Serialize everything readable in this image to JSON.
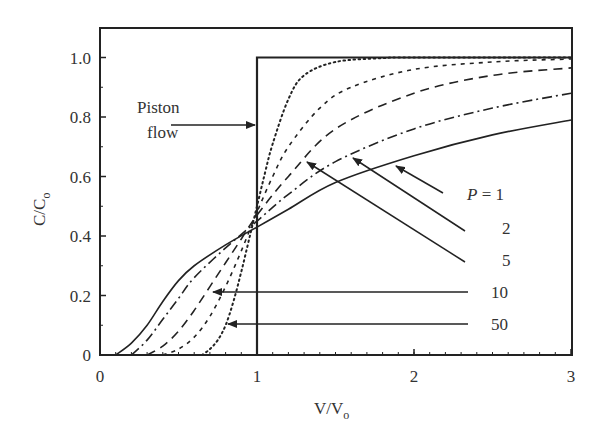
{
  "chart_data": {
    "type": "line",
    "title": "",
    "xlabel": "V/Vo",
    "ylabel": "C/Co",
    "xlim": [
      0,
      3
    ],
    "ylim": [
      0,
      1.1
    ],
    "xticks": [
      0,
      1,
      2,
      3
    ],
    "xtick_labels": [
      "0",
      "1",
      "2",
      "3"
    ],
    "yticks": [
      0,
      0.2,
      0.4,
      0.6,
      0.8,
      1.0
    ],
    "ytick_labels": [
      "0",
      "0.2",
      "0.4",
      "0.6",
      "0.8",
      "1.0"
    ],
    "grid": false,
    "legend": "inline annotations with arrows",
    "series": [
      {
        "name": "P = 1",
        "style": "solid",
        "x": [
          0.1,
          0.2,
          0.3,
          0.4,
          0.5,
          0.6,
          0.8,
          1.0,
          1.2,
          1.5,
          2.0,
          2.5,
          3.0
        ],
        "y": [
          0.0,
          0.04,
          0.1,
          0.18,
          0.25,
          0.3,
          0.37,
          0.43,
          0.49,
          0.58,
          0.67,
          0.74,
          0.79
        ]
      },
      {
        "name": "2",
        "style": "dash-dot",
        "x": [
          0.2,
          0.3,
          0.4,
          0.5,
          0.6,
          0.8,
          1.0,
          1.2,
          1.5,
          2.0,
          2.5,
          3.0
        ],
        "y": [
          0.0,
          0.05,
          0.12,
          0.19,
          0.26,
          0.36,
          0.45,
          0.54,
          0.65,
          0.76,
          0.83,
          0.88
        ]
      },
      {
        "name": "5",
        "style": "long-dash",
        "x": [
          0.3,
          0.4,
          0.5,
          0.6,
          0.7,
          0.8,
          0.9,
          1.0,
          1.2,
          1.5,
          2.0,
          2.5,
          3.0
        ],
        "y": [
          0.0,
          0.03,
          0.08,
          0.15,
          0.23,
          0.31,
          0.39,
          0.47,
          0.6,
          0.76,
          0.88,
          0.94,
          0.965
        ]
      },
      {
        "name": "10",
        "style": "short-dash",
        "x": [
          0.4,
          0.5,
          0.6,
          0.7,
          0.8,
          0.9,
          1.0,
          1.1,
          1.2,
          1.4,
          1.6,
          2.0,
          2.5,
          3.0
        ],
        "y": [
          0.0,
          0.02,
          0.06,
          0.13,
          0.23,
          0.35,
          0.48,
          0.6,
          0.7,
          0.83,
          0.9,
          0.96,
          0.985,
          0.995
        ]
      },
      {
        "name": "50",
        "style": "dotted",
        "x": [
          0.65,
          0.7,
          0.75,
          0.8,
          0.85,
          0.9,
          0.95,
          1.0,
          1.05,
          1.1,
          1.2,
          1.3,
          1.5,
          1.8,
          2.0,
          3.0
        ],
        "y": [
          0.0,
          0.02,
          0.05,
          0.1,
          0.18,
          0.28,
          0.39,
          0.5,
          0.61,
          0.71,
          0.86,
          0.94,
          0.985,
          0.998,
          1.0,
          1.0
        ]
      },
      {
        "name": "Piston flow",
        "style": "solid-heavy",
        "x": [
          0,
          1.0,
          1.0,
          3.0
        ],
        "y": [
          0,
          0,
          1.0,
          1.0
        ]
      }
    ],
    "annotations": [
      {
        "text": "Piston flow",
        "points_to": [
          1.0,
          0.77
        ]
      },
      {
        "text": "P = 1",
        "points_to": [
          1.88,
          0.64
        ]
      },
      {
        "text": "2",
        "points_to": [
          1.61,
          0.66
        ]
      },
      {
        "text": "5",
        "points_to": [
          1.32,
          0.65
        ]
      },
      {
        "text": "10",
        "points_to": [
          0.72,
          0.21
        ]
      },
      {
        "text": "50",
        "points_to": [
          0.81,
          0.11
        ]
      }
    ]
  },
  "labels": {
    "xlabel_main": "V/V",
    "xlabel_sub": "o",
    "ylabel_main": "C/C",
    "ylabel_sub": "o",
    "piston_line1": "Piston",
    "piston_line2": "flow",
    "p1": "P",
    "p1_rest": " = 1",
    "p2": "2",
    "p5": "5",
    "p10": "10",
    "p50": "50"
  }
}
